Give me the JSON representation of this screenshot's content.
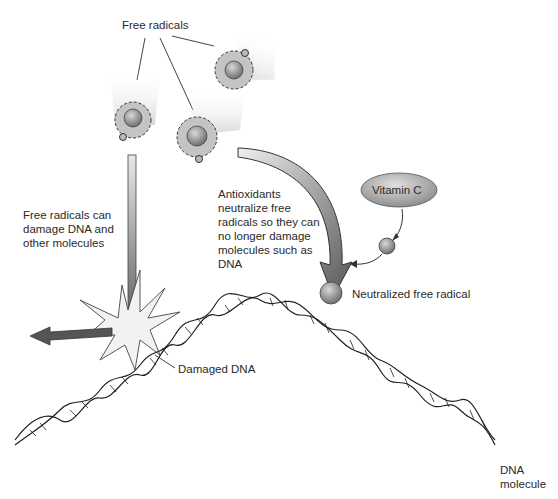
{
  "diagram": {
    "title": "Antioxidants neutralize free radicals",
    "labels": {
      "free_radicals": "Free radicals",
      "free_radicals_damage": "Free radicals can\ndamage DNA and\nother molecules",
      "antioxidants": "Antioxidants\nneutralize free\nradicals so they can\nno longer damage\nmolecules such as\nDNA",
      "vitamin_c": "Vitamin C",
      "neutralized": "Neutralized free radical",
      "damaged_dna": "Damaged DNA",
      "dna_molecule": "DNA\nmolecule"
    },
    "colors": {
      "atom_fill": "#bdbdbd",
      "nucleus": "#8a8a8a",
      "arrow": "#5a5a5a",
      "line": "#333333",
      "vitamin_c_fill": "#a8a8a8"
    }
  }
}
